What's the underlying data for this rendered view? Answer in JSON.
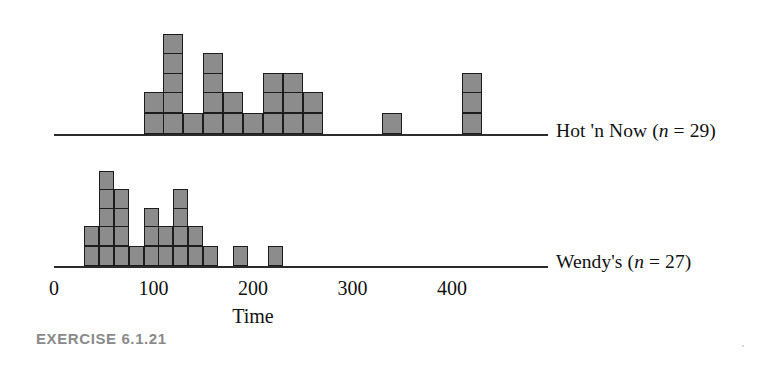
{
  "caption": "EXERCISE 6.1.21",
  "axis": {
    "title": "Time",
    "ticks": [
      {
        "label": "0",
        "value": 0
      },
      {
        "label": "100",
        "value": 100
      },
      {
        "label": "200",
        "value": 200
      },
      {
        "label": "300",
        "value": 300
      },
      {
        "label": "400",
        "value": 400
      }
    ],
    "xmin": 0,
    "xmax": 470
  },
  "series": [
    {
      "key": "hot_n_now",
      "name": "Hot 'n Now",
      "n": 29,
      "label_prefix": "Hot 'n Now (",
      "label_n": "n",
      "label_suffix": " = 29)"
    },
    {
      "key": "wendys",
      "name": "Wendy's",
      "n": 27,
      "label_prefix": "Wendy's (",
      "label_n": "n",
      "label_suffix": " = 27)"
    }
  ],
  "colors": {
    "cell_fill": "#8c8c8c",
    "cell_stroke": "#1c1c1c",
    "axis": "#2b2b2b",
    "text": "#111111",
    "caption": "#8a8a8a"
  },
  "chart_data": {
    "type": "histogram",
    "title": "",
    "xlabel": "Time",
    "ylabel": "",
    "xlim": [
      0,
      470
    ],
    "grid": false,
    "bin_width": 20,
    "legend_position": "right",
    "panels": [
      {
        "name": "Hot 'n Now",
        "n": 29,
        "annotation": "Hot 'n Now (n = 29)",
        "bins": [
          {
            "x_start": 90,
            "x_center": 100,
            "count": 2
          },
          {
            "x_start": 110,
            "x_center": 120,
            "count": 5
          },
          {
            "x_start": 130,
            "x_center": 140,
            "count": 1
          },
          {
            "x_start": 150,
            "x_center": 160,
            "count": 4
          },
          {
            "x_start": 170,
            "x_center": 180,
            "count": 2
          },
          {
            "x_start": 190,
            "x_center": 200,
            "count": 1
          },
          {
            "x_start": 210,
            "x_center": 220,
            "count": 3
          },
          {
            "x_start": 230,
            "x_center": 240,
            "count": 3
          },
          {
            "x_start": 250,
            "x_center": 260,
            "count": 2
          },
          {
            "x_start": 330,
            "x_center": 340,
            "count": 1
          },
          {
            "x_start": 410,
            "x_center": 420,
            "count": 3
          }
        ],
        "counts": [
          2,
          5,
          1,
          4,
          2,
          1,
          3,
          3,
          2,
          1,
          3
        ],
        "max_count": 5
      },
      {
        "name": "Wendy's",
        "n": 27,
        "annotation": "Wendy's (n = 27)",
        "bins": [
          {
            "x_start": 30,
            "x_center": 37,
            "count": 2
          },
          {
            "x_start": 45,
            "x_center": 52,
            "count": 5
          },
          {
            "x_start": 60,
            "x_center": 67,
            "count": 4
          },
          {
            "x_start": 75,
            "x_center": 82,
            "count": 1
          },
          {
            "x_start": 90,
            "x_center": 97,
            "count": 3
          },
          {
            "x_start": 105,
            "x_center": 112,
            "count": 2
          },
          {
            "x_start": 120,
            "x_center": 127,
            "count": 4
          },
          {
            "x_start": 135,
            "x_center": 142,
            "count": 2
          },
          {
            "x_start": 150,
            "x_center": 157,
            "count": 1
          },
          {
            "x_start": 180,
            "x_center": 187,
            "count": 1
          },
          {
            "x_start": 215,
            "x_center": 222,
            "count": 1
          }
        ],
        "counts": [
          2,
          5,
          4,
          1,
          3,
          2,
          4,
          2,
          1,
          1,
          1
        ],
        "max_count": 5
      }
    ]
  }
}
